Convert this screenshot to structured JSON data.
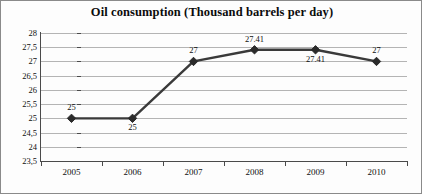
{
  "chart_data": {
    "type": "line",
    "title": "Oil consumption (Thousand barrels per day)",
    "xlabel": "",
    "ylabel": "",
    "categories": [
      "2005",
      "2006",
      "2007",
      "2008",
      "2009",
      "2010"
    ],
    "values": [
      25,
      25,
      27,
      27.41,
      27.41,
      27
    ],
    "point_labels": [
      "25",
      "25",
      "27",
      "27.41",
      "27.41",
      "27"
    ],
    "point_label_positions": [
      "above",
      "below",
      "above",
      "above",
      "below",
      "above"
    ],
    "y_ticks": [
      "28",
      "27,5",
      "27",
      "26,5",
      "26",
      "25,5",
      "25",
      "24,5",
      "24",
      "23,5"
    ],
    "y_tick_values": [
      28,
      27.5,
      27,
      26.5,
      26,
      25.5,
      25,
      24.5,
      24,
      23.5
    ],
    "ylim": [
      23.5,
      28
    ],
    "grid": true,
    "legend": "none",
    "series_color": "#3a3a3a",
    "marker": "diamond",
    "marker_color": "#2b2b2b",
    "gridline_color": "#b4b4b4",
    "axis_color": "#4a4a4a",
    "background_color": "#fdfdfd",
    "border_color": "#8a8a8a"
  }
}
